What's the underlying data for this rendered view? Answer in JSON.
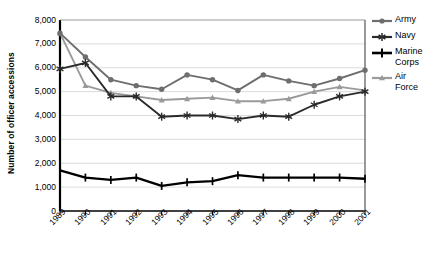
{
  "chart_data": {
    "type": "line",
    "title": "",
    "xlabel": "",
    "ylabel": "Number of officer accessions",
    "categories": [
      "1989",
      "1990",
      "1991",
      "1992",
      "1993",
      "1994",
      "1995",
      "1996",
      "1997",
      "1998",
      "1999",
      "2000",
      "2001"
    ],
    "ylim": [
      0,
      8000
    ],
    "ytick_labels": [
      "8,000",
      "7,000",
      "6,000",
      "5,000",
      "4,000",
      "3,000",
      "2,000",
      "1,000",
      "0"
    ],
    "ytick_values": [
      8000,
      7000,
      6000,
      5000,
      4000,
      3000,
      2000,
      1000,
      0
    ],
    "grid": true,
    "legend_position": "right",
    "series": [
      {
        "name": "Army",
        "marker": "circle",
        "color": "#6e6e6e",
        "values": [
          7450,
          6450,
          5500,
          5250,
          5100,
          5700,
          5500,
          5050,
          5700,
          5450,
          5250,
          5550,
          5900
        ]
      },
      {
        "name": "Navy",
        "marker": "asterisk",
        "color": "#2b2b2b",
        "values": [
          5950,
          6200,
          4800,
          4800,
          3950,
          4000,
          4000,
          3850,
          4000,
          3950,
          4450,
          4800,
          5000
        ]
      },
      {
        "name": "Marine Corps",
        "marker": "plus",
        "color": "#000000",
        "values": [
          1700,
          1400,
          1300,
          1400,
          1050,
          1200,
          1250,
          1500,
          1400,
          1400,
          1400,
          1400,
          1350
        ]
      },
      {
        "name": "Air Force",
        "marker": "triangle",
        "color": "#9a9a9a",
        "values": [
          7450,
          5250,
          4950,
          4800,
          4650,
          4700,
          4750,
          4600,
          4600,
          4700,
          5000,
          5200,
          5050
        ]
      }
    ]
  },
  "legend": {
    "items": [
      {
        "label": "Army"
      },
      {
        "label": "Navy"
      },
      {
        "label": "Marine"
      },
      {
        "label": "Corps"
      },
      {
        "label": "Air"
      },
      {
        "label": "Force"
      }
    ]
  },
  "axis": {
    "y_title": "Number of officer accessions"
  }
}
